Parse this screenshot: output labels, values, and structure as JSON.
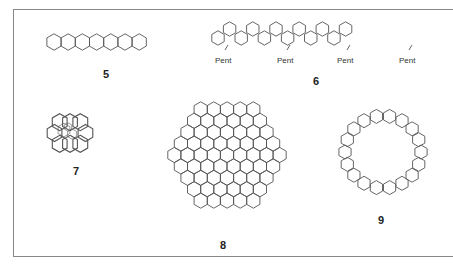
{
  "figure": {
    "structures": [
      {
        "id": "5",
        "label": "5",
        "description": "heptacene (7 linearly fused rings)"
      },
      {
        "id": "6",
        "label": "6",
        "description": "fused polyarene ribbon with four Pent substituents",
        "substituents": [
          "Pent",
          "Pent",
          "Pent",
          "Pent"
        ]
      },
      {
        "id": "7",
        "label": "7",
        "description": "helical helicene-like stacked hexagons"
      },
      {
        "id": "8",
        "label": "8",
        "description": "hexagonal nanographene, rows 5-6-7-8-9-8-7-6-5"
      },
      {
        "id": "9",
        "label": "9",
        "description": "cyclic fused arene macrocycle (nanoring)"
      }
    ]
  },
  "colors": {
    "line": "#555555",
    "frame": "#888888",
    "text": "#222222"
  }
}
